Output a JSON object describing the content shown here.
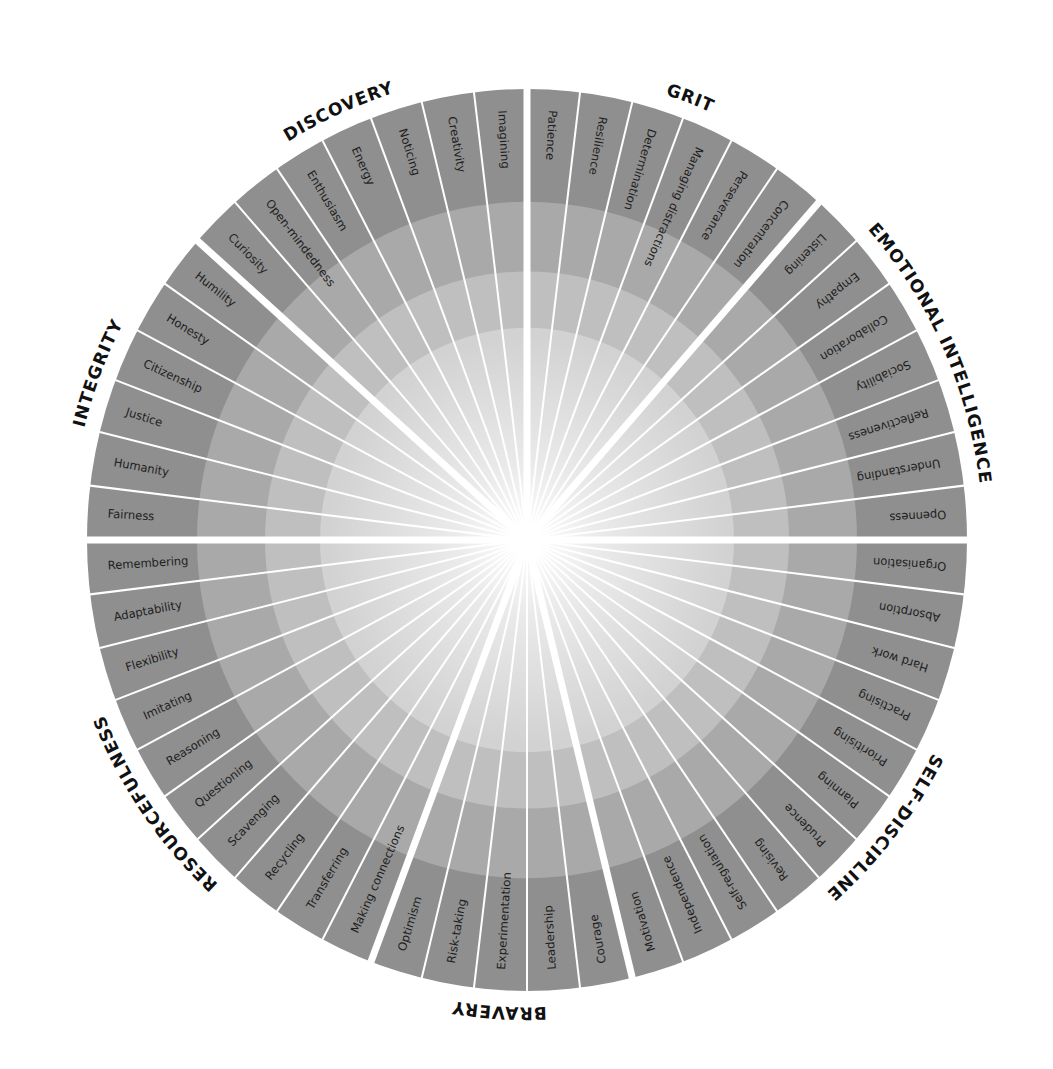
{
  "chart_data": {
    "type": "radial-wheel",
    "title": "",
    "total_segments": 52,
    "start_angle_deg": 0,
    "direction": "clockwise",
    "rings": [
      {
        "name": "outer",
        "color": "#8f8f8f"
      },
      {
        "name": "ring-2",
        "color": "#a9a9a9"
      },
      {
        "name": "ring-3",
        "color": "#bfbfbf"
      },
      {
        "name": "inner",
        "color": "#d2d2d2"
      },
      {
        "name": "center-glow",
        "color": "#ffffff"
      }
    ],
    "categories": [
      {
        "name": "GRIT",
        "items": [
          "Patience",
          "Resilience",
          "Determination",
          "Managing distractions",
          "Perseverance",
          "Concentration"
        ]
      },
      {
        "name": "EMOTIONAL INTELLIGENCE",
        "items": [
          "Listening",
          "Empathy",
          "Collaboration",
          "Sociability",
          "Reflectiveness",
          "Understanding",
          "Openness"
        ]
      },
      {
        "name": "SELF-DISCIPLINE",
        "items": [
          "Organisation",
          "Absorption",
          "Hard work",
          "Practising",
          "Prioritising",
          "Planning",
          "Prudence",
          "Revising",
          "Self-regulation",
          "Independence",
          "Motivation"
        ]
      },
      {
        "name": "BRAVERY",
        "items": [
          "Courage",
          "Leadership",
          "Experimentation",
          "Risk-taking",
          "Optimism"
        ]
      },
      {
        "name": "RESOURCEFULNESS",
        "items": [
          "Making connections",
          "Transferring",
          "Recycling",
          "Scavenging",
          "Questioning",
          "Reasoning",
          "Imitating",
          "Flexibility",
          "Adaptability",
          "Remembering"
        ]
      },
      {
        "name": "INTEGRITY",
        "items": [
          "Fairness",
          "Humanity",
          "Justice",
          "Citizenship",
          "Honesty",
          "Humility"
        ]
      },
      {
        "name": "DISCOVERY",
        "items": [
          "Curiosity",
          "Open-mindedness",
          "Enthusiasm",
          "Energy",
          "Noticing",
          "Creativity",
          "Imagining"
        ]
      }
    ]
  },
  "colors": {
    "background": "#ffffff",
    "divider": "#ffffff",
    "text": "#1e1e1e",
    "category_text": "#111111"
  }
}
